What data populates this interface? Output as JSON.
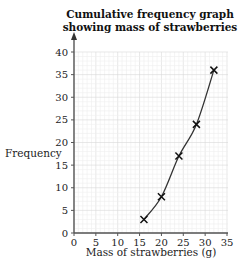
{
  "chart_data": {
    "type": "line",
    "title": "Cumulative frequency graph showing mass of strawberries",
    "xlabel": "Mass of strawberries (g)",
    "ylabel": "Frequency",
    "xlim": [
      0,
      35
    ],
    "ylim": [
      0,
      40
    ],
    "x_ticks": [
      0,
      5,
      10,
      15,
      20,
      25,
      30,
      35
    ],
    "y_ticks": [
      0,
      5,
      10,
      15,
      20,
      25,
      30,
      35,
      40
    ],
    "grid": true,
    "legend": null,
    "series": [
      {
        "name": "Cumulative frequency",
        "marker": "x",
        "smooth": true,
        "points": [
          {
            "x": 16,
            "y": 3
          },
          {
            "x": 20,
            "y": 8
          },
          {
            "x": 24,
            "y": 17
          },
          {
            "x": 28,
            "y": 24
          },
          {
            "x": 32,
            "y": 36
          }
        ]
      }
    ]
  }
}
